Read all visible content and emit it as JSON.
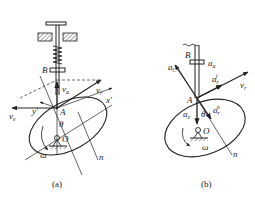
{
  "figure_a": {
    "caption": "(a)",
    "labels": {
      "B": "B",
      "A": "A",
      "O": "O",
      "theta": "θ",
      "omega": "ω",
      "n": "n",
      "x_prime": "x'",
      "y_prime": "y'",
      "v_a": "v",
      "v_a_sub": "a",
      "v_r": "v",
      "v_r_sub": "r",
      "v_e": "v",
      "v_e_sub": "e"
    }
  },
  "figure_b": {
    "caption": "(b)",
    "labels": {
      "B": "B",
      "A": "A",
      "O": "O",
      "theta": "θ",
      "omega": "ω",
      "n": "n",
      "a_a": "a",
      "a_a_sub": "a",
      "a_C": "a",
      "a_C_sub": "C",
      "a_r_t": "a",
      "a_r_t_sub": "r",
      "a_r_t_sup": "t",
      "a_r_n": "a",
      "a_r_n_sub": "r",
      "a_r_n_sup": "n",
      "a_e": "a",
      "a_e_sub": "e",
      "v_r": "v",
      "v_r_sub": "r"
    }
  }
}
